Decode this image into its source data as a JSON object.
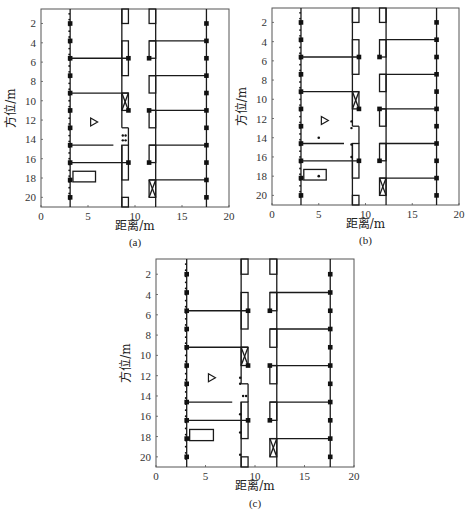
{
  "figure_header_text": "",
  "chart_data": [
    {
      "type": "scatter",
      "panel": "a",
      "caption": "(a)",
      "xlabel": "距离/m",
      "ylabel": "方位/m",
      "xlim": [
        0,
        20
      ],
      "ylim": [
        21,
        0.5
      ],
      "xticks": [
        0,
        5,
        10,
        15,
        20
      ],
      "yticks": [
        2,
        4,
        6,
        8,
        10,
        12,
        14,
        16,
        18,
        20
      ],
      "grid": false,
      "extra_points": [],
      "door_dots": [
        [
          8.7,
          13.6
        ],
        [
          9.0,
          13.6
        ],
        [
          8.7,
          14.1
        ],
        [
          9.0,
          14.1
        ]
      ]
    },
    {
      "type": "scatter",
      "panel": "b",
      "caption": "(b)",
      "xlabel": "距离/m",
      "ylabel": "方位/m",
      "xlim": [
        0,
        20
      ],
      "ylim": [
        21,
        0.5
      ],
      "xticks": [
        0,
        5,
        10,
        15,
        20
      ],
      "yticks": [
        2,
        4,
        6,
        8,
        10,
        12,
        14,
        16,
        18,
        20
      ],
      "grid": false,
      "extra_points": [
        [
          5.0,
          14.0
        ],
        [
          5.0,
          18.0
        ]
      ],
      "door_dots": [
        [
          8.5,
          12.3
        ],
        [
          8.5,
          13.0
        ],
        [
          8.5,
          14.7
        ],
        [
          8.5,
          16.0
        ]
      ]
    },
    {
      "type": "scatter",
      "panel": "c",
      "caption": "(c)",
      "xlabel": "距离/m",
      "ylabel": "方位/m",
      "xlim": [
        0,
        20
      ],
      "ylim": [
        21,
        0.5
      ],
      "xticks": [
        0,
        5,
        10,
        15,
        20
      ],
      "yticks": [
        2,
        4,
        6,
        8,
        10,
        12,
        14,
        16,
        18,
        20
      ],
      "grid": false,
      "extra_points": [],
      "door_dots": [
        [
          8.5,
          12.2
        ],
        [
          8.5,
          12.8
        ],
        [
          8.8,
          14.0
        ],
        [
          9.1,
          14.0
        ],
        [
          8.5,
          15.8
        ],
        [
          8.5,
          17.6
        ],
        [
          8.5,
          19.8
        ]
      ]
    }
  ],
  "scene": {
    "left_wall_x": 3.1,
    "left_wall_dots_x": 3.0,
    "left_wall_markers_y": [
      2,
      3.8,
      5.6,
      7.4,
      9.2,
      11,
      12.8,
      14.6,
      16.4,
      18.2,
      20
    ],
    "right_line_x": 17.6,
    "right_markers_y": [
      2,
      3.8,
      5.6,
      7.4,
      9.2,
      11,
      12.8,
      14.6,
      16.4,
      18.2,
      20
    ],
    "left_horizontal_lines": [
      {
        "y": 5.6,
        "x1": 3.1,
        "x2": 9.3
      },
      {
        "y": 9.2,
        "x1": 3.1,
        "x2": 9.3
      },
      {
        "y": 14.6,
        "x1": 3.1,
        "x2": 7.7
      },
      {
        "y": 16.4,
        "x1": 3.1,
        "x2": 9.3
      }
    ],
    "right_horizontal_lines": [
      {
        "y": 3.8,
        "x1": 11.5,
        "x2": 17.6
      },
      {
        "y": 7.4,
        "x1": 11.5,
        "x2": 17.6
      },
      {
        "y": 11.0,
        "x1": 11.5,
        "x2": 17.6
      },
      {
        "y": 14.6,
        "x1": 11.5,
        "x2": 17.6
      },
      {
        "y": 18.2,
        "x1": 11.5,
        "x2": 17.6
      }
    ],
    "corridor_left_x": 8.6,
    "corridor_left_gap": [
      12.8,
      14.6
    ],
    "corridor_left_boxes": [
      {
        "y1": 0.5,
        "y2": 2.0,
        "x1": 8.6,
        "x2": 9.3
      },
      {
        "y1": 3.8,
        "y2": 7.4,
        "x1": 8.6,
        "x2": 9.3
      },
      {
        "y1": 9.2,
        "y2": 11.0,
        "x1": 8.6,
        "x2": 9.3,
        "cross": true
      },
      {
        "y1": 14.6,
        "y2": 18.2,
        "x1": 8.6,
        "x2": 9.3
      },
      {
        "y1": 20.0,
        "y2": 21.0,
        "x1": 8.6,
        "x2": 9.3
      }
    ],
    "corridor_left_step": [
      [
        8.6,
        12.8
      ],
      [
        9.3,
        12.8
      ],
      [
        9.3,
        14.6
      ]
    ],
    "corridor_left_markers": [
      [
        9.3,
        5.6
      ],
      [
        9.3,
        11.0
      ],
      [
        9.3,
        16.4
      ]
    ],
    "corridor_right_x": 12.2,
    "corridor_right_boxes": [
      {
        "y1": 0.5,
        "y2": 2.0,
        "x1": 11.5,
        "x2": 12.2
      },
      {
        "y1": 3.8,
        "y2": 5.6,
        "x1": 11.5,
        "x2": 12.2
      },
      {
        "y1": 7.4,
        "y2": 9.2,
        "x1": 11.5,
        "x2": 12.2
      },
      {
        "y1": 11.0,
        "y2": 12.8,
        "x1": 11.5,
        "x2": 12.2
      },
      {
        "y1": 14.6,
        "y2": 16.4,
        "x1": 11.5,
        "x2": 12.2
      },
      {
        "y1": 18.2,
        "y2": 20.0,
        "x1": 11.5,
        "x2": 12.2,
        "cross": true
      }
    ],
    "corridor_right_markers": [
      [
        11.5,
        5.6
      ],
      [
        11.5,
        11.0
      ],
      [
        11.5,
        16.4
      ]
    ],
    "triangle": {
      "x": 5.6,
      "y": 12.2
    },
    "rectangle": {
      "x1": 3.4,
      "x2": 5.8,
      "y1": 17.3,
      "y2": 18.4
    }
  },
  "colors": {
    "line": "#1a1a1a",
    "frame": "#555555",
    "marker": "#111111"
  }
}
